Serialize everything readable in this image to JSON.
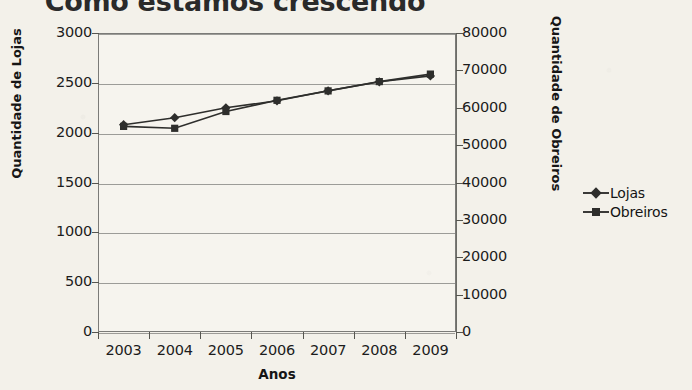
{
  "chart_data": {
    "type": "line",
    "title": "Como estamos crescendo",
    "xlabel": "Anos",
    "categories": [
      "2003",
      "2004",
      "2005",
      "2006",
      "2007",
      "2008",
      "2009"
    ],
    "grid": true,
    "legend_position": "right",
    "axes": {
      "left": {
        "label": "Quantidade de Lojas",
        "ylim": [
          0,
          3000
        ],
        "ticks": [
          "0",
          "500",
          "1000",
          "1500",
          "2000",
          "2500",
          "3000"
        ],
        "tick_values": [
          0,
          500,
          1000,
          1500,
          2000,
          2500,
          3000
        ]
      },
      "right": {
        "label": "Quantidade de Obreiros",
        "ylim": [
          0,
          80000
        ],
        "ticks": [
          "0",
          "10000",
          "20000",
          "30000",
          "40000",
          "50000",
          "60000",
          "70000",
          "80000"
        ],
        "tick_values": [
          0,
          10000,
          20000,
          30000,
          40000,
          50000,
          60000,
          70000,
          80000
        ]
      }
    },
    "series": [
      {
        "name": "Lojas",
        "axis": "left",
        "marker": "diamond",
        "color": "#2e2e2c",
        "values": [
          2080,
          2150,
          2250,
          2320,
          2420,
          2510,
          2570
        ]
      },
      {
        "name": "Obreiros",
        "axis": "right",
        "marker": "square",
        "color": "#2e2e2c",
        "values": [
          55000,
          54500,
          59000,
          62000,
          64500,
          67000,
          69000
        ]
      }
    ]
  },
  "legend": {
    "items": [
      {
        "label": "Lojas",
        "marker": "diamond"
      },
      {
        "label": "Obreiros",
        "marker": "square"
      }
    ]
  }
}
